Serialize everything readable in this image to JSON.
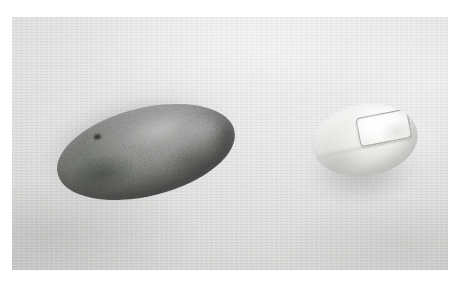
{
  "image": {
    "kind": "photograph",
    "caption": "A smooth dark grey river stone and a pale oval bar of soap resting side by side on a light grey woven cloth surface",
    "background_label": "woven cloth surface",
    "frame": {
      "canvas_width": 460,
      "canvas_height": 286,
      "photo_left": 12,
      "photo_top": 17,
      "photo_width": 436,
      "photo_height": 253
    },
    "colors": {
      "page": "#ffffff",
      "background_light": "#eceeec",
      "background_mid": "#dedfdd",
      "background_dark": "#bdbfbc",
      "stone_highlight": "#7e807c",
      "stone_mid": "#5f615e",
      "stone_shadow": "#343634",
      "soap_highlight": "#fbfbfa",
      "soap_mid": "#e7e7e4",
      "soap_shadow": "#bcbdb9",
      "label_fill": "#ffffff",
      "label_outline": "#767875",
      "cast_shadow": "#5c5f5d"
    },
    "objects": [
      {
        "id": "stone",
        "label": "dark grey river stone",
        "shape": "elongated oval",
        "center_x": 146,
        "center_y": 152,
        "width": 182,
        "height": 88,
        "rotation_deg": -14,
        "surface": "smooth speckled matte",
        "shadow_direction": "lower-left"
      },
      {
        "id": "soap",
        "label": "pale oval bar of soap",
        "shape": "rounded oval bar",
        "center_x": 365,
        "center_y": 140,
        "width": 106,
        "height": 72,
        "rotation_deg": -9,
        "surface": "glossy pale cream",
        "shadow_direction": "lower-left",
        "detail": {
          "id": "soap-label",
          "label": "embossed rectangular label panel",
          "shape": "rounded rectangle",
          "text": "",
          "rotation_deg": -2
        }
      }
    ],
    "lighting": {
      "key_light_direction": "upper-right",
      "shadow_direction": "lower-left",
      "quality": "soft diffuse"
    }
  }
}
